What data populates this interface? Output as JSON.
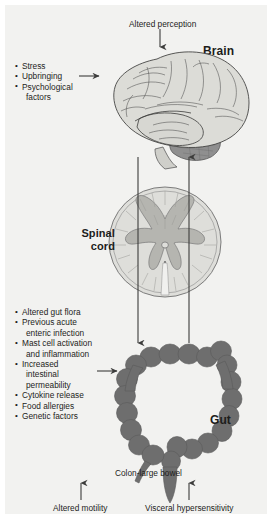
{
  "figure": {
    "background_color": "#f2f2f0",
    "ink_color": "#1d1d1b"
  },
  "brain_section": {
    "region_label": "Brain",
    "input_caption": "Altered perception",
    "factors_heading": "",
    "factors": [
      {
        "text": "Stress",
        "continuation": false
      },
      {
        "text": "Upbringing",
        "continuation": false
      },
      {
        "text": "Psychological",
        "continuation": false
      },
      {
        "text": "factors",
        "continuation": true
      }
    ],
    "illustration": "brain-lateral-view",
    "fill_color": "#d9d9d6",
    "cerebellum_color": "#8c8c8c"
  },
  "spinal_section": {
    "region_label_line1": "Spinal",
    "region_label_line2": "cord",
    "illustration": "spinal-cord-cross-section",
    "white_matter_color": "#dcdcd8",
    "grey_matter_color": "#b8b8b4"
  },
  "gut_section": {
    "region_label": "Gut",
    "anatomy_caption": "Colon-large bowel",
    "factors": [
      {
        "text": "Altered gut flora",
        "continuation": false
      },
      {
        "text": "Previous acute",
        "continuation": false
      },
      {
        "text": "enteric infection",
        "continuation": true
      },
      {
        "text": "Mast cell activation",
        "continuation": false
      },
      {
        "text": "and inflammation",
        "continuation": true
      },
      {
        "text": "Increased",
        "continuation": false
      },
      {
        "text": "intestinal",
        "continuation": true
      },
      {
        "text": "permeability",
        "continuation": true
      },
      {
        "text": "Cytokine release",
        "continuation": false
      },
      {
        "text": "Food allergies",
        "continuation": false
      },
      {
        "text": "Genetic factors",
        "continuation": false
      }
    ],
    "illustration": "colon-large-bowel",
    "fill_color": "#6e6e6e"
  },
  "outputs": {
    "left_caption": "Altered motility",
    "right_caption": "Visceral hypersensitivity"
  },
  "arrows": {
    "descending_pathway": "brain-to-gut",
    "ascending_pathway": "gut-to-brain",
    "stroke_color": "#3c3c3b"
  }
}
